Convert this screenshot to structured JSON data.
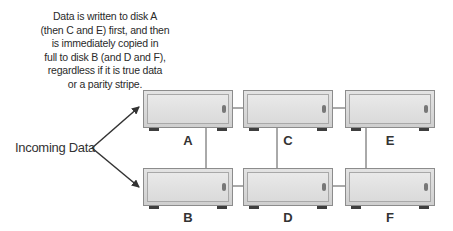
{
  "annotation": {
    "lines": [
      "Data is written to disk A",
      "(then C and E) first, and then",
      "is immediately copied in",
      "full to disk B (and D and F),",
      "regardless if it is true data",
      "or a parity stripe."
    ]
  },
  "source": {
    "label": "Incoming Data"
  },
  "disks": {
    "top": [
      {
        "id": "A",
        "label": "A"
      },
      {
        "id": "C",
        "label": "C"
      },
      {
        "id": "E",
        "label": "E"
      }
    ],
    "bottom": [
      {
        "id": "B",
        "label": "B"
      },
      {
        "id": "D",
        "label": "D"
      },
      {
        "id": "F",
        "label": "F"
      }
    ]
  },
  "mirror_pairs": [
    [
      "A",
      "B"
    ],
    [
      "C",
      "D"
    ],
    [
      "E",
      "F"
    ]
  ]
}
